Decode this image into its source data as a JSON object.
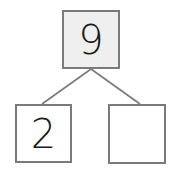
{
  "number_bond": {
    "whole": {
      "value": "9",
      "fill": "#efefef"
    },
    "parts": [
      {
        "value": "2"
      },
      {
        "value": ""
      }
    ],
    "border_color": "#7a7a7a",
    "line_color": "#7a7a7a"
  }
}
